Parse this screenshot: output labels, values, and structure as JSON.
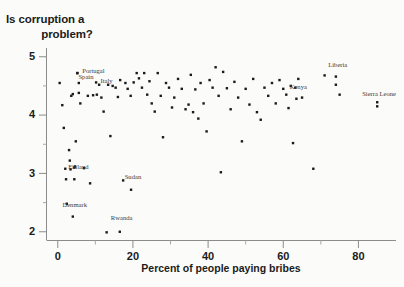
{
  "title": {
    "line1": "Is corruption a",
    "line2": "problem?"
  },
  "chart_data": {
    "type": "scatter",
    "title": "Is corruption a problem?",
    "xlabel": "Percent of people paying bribes",
    "ylabel": "",
    "xlim": [
      -3,
      90
    ],
    "ylim": [
      1.85,
      5.15
    ],
    "xticks": [
      "0",
      "20",
      "40",
      "60",
      "80"
    ],
    "xtick_values": [
      0,
      20,
      40,
      60,
      80
    ],
    "yticks": [
      "5",
      "4",
      "3",
      "2"
    ],
    "ytick_values": [
      5,
      4,
      3,
      2
    ],
    "grid": false,
    "legend": "none",
    "marker": "filled-square",
    "marker_color": "#1a1a1a",
    "points": [
      [
        0.5,
        4.55
      ],
      [
        1.2,
        4.17
      ],
      [
        1.6,
        3.78
      ],
      [
        2.0,
        3.08
      ],
      [
        2.2,
        2.9
      ],
      [
        2.4,
        2.48
      ],
      [
        3.0,
        3.4
      ],
      [
        3.2,
        3.22
      ],
      [
        3.4,
        3.07
      ],
      [
        3.6,
        4.33
      ],
      [
        4.0,
        4.36
      ],
      [
        4.4,
        3.1
      ],
      [
        4.6,
        3.12
      ],
      [
        4.8,
        3.55
      ],
      [
        5.2,
        4.72
      ],
      [
        5.6,
        4.38
      ],
      [
        6.0,
        4.2
      ],
      [
        7.0,
        3.09
      ],
      [
        8.0,
        4.33
      ],
      [
        8.6,
        2.83
      ],
      [
        9.4,
        4.34
      ],
      [
        10.4,
        4.35
      ],
      [
        11.0,
        4.52
      ],
      [
        11.6,
        4.3
      ],
      [
        12.2,
        4.06
      ],
      [
        13.0,
        1.99
      ],
      [
        13.4,
        4.52
      ],
      [
        14.0,
        3.64
      ],
      [
        14.6,
        4.5
      ],
      [
        15.4,
        4.47
      ],
      [
        16.0,
        4.31
      ],
      [
        16.6,
        4.6
      ],
      [
        17.4,
        2.88
      ],
      [
        18.0,
        4.55
      ],
      [
        18.6,
        4.45
      ],
      [
        19.4,
        4.33
      ],
      [
        20.2,
        4.56
      ],
      [
        21.0,
        4.72
      ],
      [
        21.6,
        4.63
      ],
      [
        22.4,
        4.47
      ],
      [
        23.0,
        4.72
      ],
      [
        23.8,
        4.35
      ],
      [
        24.4,
        4.58
      ],
      [
        25.0,
        4.2
      ],
      [
        25.8,
        4.06
      ],
      [
        26.6,
        4.72
      ],
      [
        27.4,
        4.33
      ],
      [
        28.0,
        3.62
      ],
      [
        28.8,
        4.55
      ],
      [
        29.6,
        4.47
      ],
      [
        30.4,
        4.13
      ],
      [
        31.0,
        4.3
      ],
      [
        32.0,
        4.62
      ],
      [
        33.0,
        4.45
      ],
      [
        34.0,
        4.1
      ],
      [
        34.8,
        4.18
      ],
      [
        35.4,
        4.69
      ],
      [
        36.0,
        4.05
      ],
      [
        36.6,
        4.44
      ],
      [
        37.4,
        3.94
      ],
      [
        38.0,
        4.55
      ],
      [
        38.8,
        4.2
      ],
      [
        39.6,
        3.72
      ],
      [
        40.4,
        4.6
      ],
      [
        41.2,
        4.47
      ],
      [
        42.0,
        4.82
      ],
      [
        42.8,
        4.33
      ],
      [
        43.4,
        3.02
      ],
      [
        44.0,
        4.74
      ],
      [
        45.0,
        4.46
      ],
      [
        46.0,
        4.1
      ],
      [
        47.0,
        4.57
      ],
      [
        48.0,
        4.3
      ],
      [
        49.0,
        3.55
      ],
      [
        50.0,
        4.45
      ],
      [
        51.0,
        4.18
      ],
      [
        52.0,
        4.62
      ],
      [
        53.0,
        4.05
      ],
      [
        54.0,
        3.92
      ],
      [
        55.0,
        4.47
      ],
      [
        56.0,
        4.33
      ],
      [
        57.0,
        4.55
      ],
      [
        58.0,
        4.2
      ],
      [
        59.0,
        4.6
      ],
      [
        60.0,
        4.45
      ],
      [
        60.8,
        4.35
      ],
      [
        61.4,
        4.12
      ],
      [
        62.0,
        4.5
      ],
      [
        62.6,
        3.52
      ],
      [
        63.2,
        4.47
      ],
      [
        64.0,
        4.62
      ],
      [
        65.0,
        4.3
      ],
      [
        68.0,
        3.08
      ],
      [
        71.0,
        4.68
      ],
      [
        74.0,
        4.52
      ],
      [
        75.0,
        4.35
      ],
      [
        85.0,
        4.22
      ]
    ],
    "annotations": [
      {
        "label": "Portugal",
        "label_x": 9.5,
        "label_y": 4.72,
        "point_x": 5.2,
        "point_y": 4.72
      },
      {
        "label": "Spain",
        "label_x": 7.5,
        "label_y": 4.62,
        "point_x": 5.6,
        "point_y": 4.55
      },
      {
        "label": "Italy",
        "label_x": 13.0,
        "label_y": 4.55,
        "point_x": 10.2,
        "point_y": 4.56
      },
      {
        "label": "Finland",
        "label_x": 5.5,
        "label_y": 3.08,
        "point_x": 4.4,
        "point_y": 2.9
      },
      {
        "label": "Sudan",
        "label_x": 20.0,
        "label_y": 2.9,
        "point_x": 19.5,
        "point_y": 2.72
      },
      {
        "label": "Denmark",
        "label_x": 4.5,
        "label_y": 2.42,
        "point_x": 4.0,
        "point_y": 2.26
      },
      {
        "label": "Rwanda",
        "label_x": 17.0,
        "label_y": 2.2,
        "point_x": 16.5,
        "point_y": 2.0
      },
      {
        "label": "Liberia",
        "label_x": 74.5,
        "label_y": 4.82,
        "point_x": 74.0,
        "point_y": 4.66
      },
      {
        "label": "Kenya",
        "label_x": 64.0,
        "label_y": 4.44,
        "point_x": 63.5,
        "point_y": 4.28
      },
      {
        "label": "Sierra Leone",
        "label_x": 85.5,
        "label_y": 4.32,
        "point_x": 85.0,
        "point_y": 4.15
      }
    ]
  }
}
